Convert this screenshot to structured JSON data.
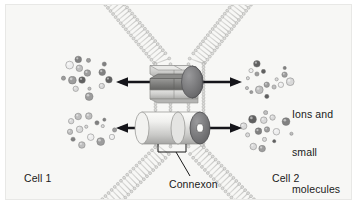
{
  "figure": {
    "topic": "gap-junction",
    "background_color": "#f7f7f5",
    "border_color": "#e8e8e6",
    "ink_color": "#1a1a1a"
  },
  "labels": {
    "cell1": "Cell 1",
    "cell2": "Cell 2",
    "connexon": "Connexon",
    "ions_line1": "Ions and",
    "ions_line2": "small",
    "ions_line3": "molecules"
  },
  "membranes": {
    "description": "two phospholipid bilayers converging in an hourglass crossing",
    "head_color": "#d8d8d6",
    "head_outline": "#a8a8a6",
    "tail_color": "#c6c6c4",
    "count": 2
  },
  "connexons": [
    {
      "name": "upper-connexon",
      "style": "hexagonal-prism-pair",
      "cx": 178,
      "cy": 82,
      "body_color": "#d0d0ce",
      "shade_color": "#8e8e8c",
      "cap_color": "#6f6f6d"
    },
    {
      "name": "lower-connexon",
      "style": "cylinder-pair",
      "cx": 178,
      "cy": 128,
      "body_color": "#ededeb",
      "shade_color": "#b6b6b4",
      "cap_color": "#78787a",
      "pore_color": "#fdfdfd"
    }
  ],
  "arrows": [
    {
      "name": "upper-transport-arrow",
      "y": 82,
      "x1": 118,
      "x2": 240,
      "double_headed": true
    },
    {
      "name": "lower-transport-arrow",
      "y": 128,
      "x1": 118,
      "x2": 240,
      "double_headed": true
    }
  ],
  "particle_clusters": [
    {
      "name": "cluster-cell1-upper",
      "cx": 88,
      "cy": 78,
      "count": 15
    },
    {
      "name": "cluster-cell1-lower",
      "cx": 90,
      "cy": 130,
      "count": 15
    },
    {
      "name": "cluster-cell2-upper",
      "cx": 266,
      "cy": 78,
      "count": 16
    },
    {
      "name": "cluster-cell2-lower",
      "cx": 268,
      "cy": 130,
      "count": 15
    }
  ],
  "particles": {
    "legend": "ions and small molecules",
    "shades": [
      "#5a5a5a",
      "#7d7d7d",
      "#9a9a9a",
      "#bdbdbd",
      "#d8d8d8",
      "#eeeeee"
    ],
    "radii": [
      1.6,
      2.1,
      2.7,
      3.3,
      3.9
    ]
  },
  "leader_line": {
    "name": "connexon-leader",
    "from_x": 180,
    "from_y": 148,
    "to_x": 192,
    "to_y": 176
  }
}
